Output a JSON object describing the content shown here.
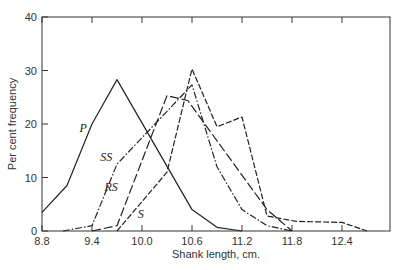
{
  "chart_data": {
    "type": "line",
    "title": "",
    "xlabel": "Shank length, cm.",
    "ylabel": "Per cent frequency",
    "xlim": [
      8.8,
      12.95
    ],
    "ylim": [
      0,
      40
    ],
    "x_ticks": [
      "8.8",
      "9.4",
      "10.0",
      "10.6",
      "11.2",
      "11.8",
      "12.4"
    ],
    "y_ticks": [
      "0",
      "10",
      "20",
      "30",
      "40"
    ],
    "grid": false,
    "legend": "inline labels",
    "series": [
      {
        "name": "P",
        "style": "solid",
        "x": [
          8.8,
          9.1,
          9.4,
          9.7,
          10.6,
          10.9,
          11.2
        ],
        "y": [
          3.5,
          8.5,
          20,
          28.3,
          4,
          0.7,
          0
        ],
        "label_pos": [
          9.25,
          18.5
        ]
      },
      {
        "name": "SS",
        "style": "dashdot",
        "x": [
          9.05,
          9.4,
          9.7,
          10.6,
          10.9,
          11.2,
          11.5,
          11.8
        ],
        "y": [
          0,
          1,
          12.5,
          27.3,
          12,
          4,
          1,
          0
        ],
        "label_pos": [
          9.5,
          13
        ]
      },
      {
        "name": "RS",
        "style": "dashed",
        "x": [
          9.4,
          9.7,
          10.3,
          10.55,
          11.5,
          11.8
        ],
        "y": [
          0,
          1,
          25.3,
          24.4,
          4,
          0
        ],
        "label_pos": [
          9.55,
          7.5
        ]
      },
      {
        "name": "S",
        "style": "dashed-short",
        "x": [
          9.7,
          10.3,
          10.6,
          10.9,
          11.2,
          11.5,
          11.85,
          12.4,
          12.7
        ],
        "y": [
          0,
          11,
          30.3,
          19.5,
          21.3,
          2.8,
          1.8,
          1.6,
          0
        ],
        "label_pos": [
          9.95,
          2.5
        ]
      }
    ]
  },
  "labels": {
    "xlabel": "Shank length, cm.",
    "ylabel": "Per cent frequency",
    "series": [
      "P",
      "SS",
      "RS",
      "S"
    ]
  }
}
